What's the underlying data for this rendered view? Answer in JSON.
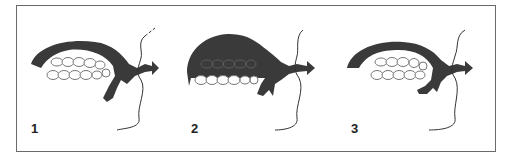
{
  "figure": {
    "panels": [
      {
        "label": "1",
        "variant": "thin arc over teeth, tongue low"
      },
      {
        "label": "2",
        "variant": "large mass filling upper region over teeth"
      },
      {
        "label": "3",
        "variant": "thin arc, teeth closed, tongue tip raised"
      }
    ]
  },
  "colors": {
    "fill": "#3a3a3a",
    "frame": "#6a6a6a",
    "teeth_outline": "#777777"
  }
}
